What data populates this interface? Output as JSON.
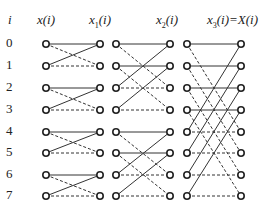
{
  "headers": {
    "i": "i",
    "x0": "x(i)",
    "x1_base": "x",
    "x1_sub": "1",
    "x1_tail": "(i)",
    "x2_base": "x",
    "x2_sub": "2",
    "x2_tail": "(i)",
    "x3_base": "x",
    "x3_sub": "3",
    "x3_tail": "(i)=X(i)"
  },
  "indices": [
    "0",
    "1",
    "2",
    "3",
    "4",
    "5",
    "6",
    "7"
  ],
  "diagram": {
    "type": "fft-butterfly-8-point",
    "line_color": "#333333",
    "node_color": "#222222",
    "stages": [
      {
        "span": 1,
        "pairs": [
          [
            0,
            1
          ],
          [
            2,
            3
          ],
          [
            4,
            5
          ],
          [
            6,
            7
          ]
        ]
      },
      {
        "span": 2,
        "pairs": [
          [
            0,
            2
          ],
          [
            1,
            3
          ],
          [
            4,
            6
          ],
          [
            5,
            7
          ]
        ]
      },
      {
        "span": 4,
        "pairs": [
          [
            0,
            4
          ],
          [
            1,
            5
          ],
          [
            2,
            6
          ],
          [
            3,
            7
          ]
        ]
      }
    ]
  }
}
